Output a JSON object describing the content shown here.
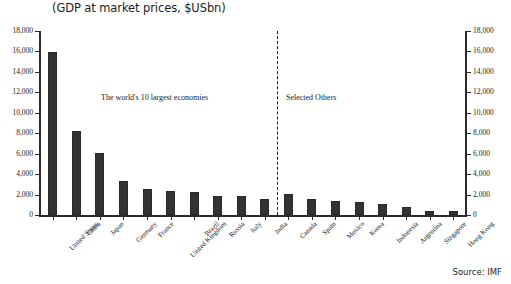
{
  "chart_data": {
    "type": "bar",
    "title": "(GDP at market prices, $USbn)",
    "xlabel": "",
    "ylabel": "",
    "ylim": [
      0,
      18000
    ],
    "ytick_step": 2000,
    "yticks": [
      "0",
      "2,000",
      "4,000",
      "6,000",
      "8,000",
      "10,000",
      "12,000",
      "14,000",
      "16,000",
      "18,000"
    ],
    "grid": false,
    "legend": "none",
    "dual_axis": true,
    "right_axis_same_as_left": true,
    "categories": [
      "United States",
      "China",
      "Japan",
      "Germany",
      "France",
      "United Kingdom",
      "Brazil",
      "Russia",
      "Italy",
      "India",
      "Canada",
      "Spain",
      "Mexico",
      "Korea",
      "Indonesia",
      "Argentina",
      "Singapore",
      "Hong Kong"
    ],
    "values": [
      15950,
      8220,
      6060,
      3330,
      2540,
      2350,
      2250,
      1860,
      1860,
      1570,
      2050,
      1570,
      1370,
      1270,
      1080,
      780,
      390,
      380
    ],
    "series": [
      {
        "name": "GDP at market prices, $USbn",
        "values": [
          15950,
          8220,
          6060,
          3330,
          2540,
          2350,
          2250,
          1860,
          1860,
          1570,
          2050,
          1570,
          1370,
          1270,
          1080,
          780,
          390,
          380
        ]
      }
    ],
    "annotations": [
      {
        "text": "The world's 10 largest economies",
        "group": "left"
      },
      {
        "text": "Selected Others",
        "group": "right"
      }
    ],
    "divider": {
      "after_category": "India",
      "style": "dashed"
    },
    "source": "Source: IMF",
    "bar_color": "#333333",
    "axis_color": "#2b2b2b",
    "background": "#ffffff"
  }
}
